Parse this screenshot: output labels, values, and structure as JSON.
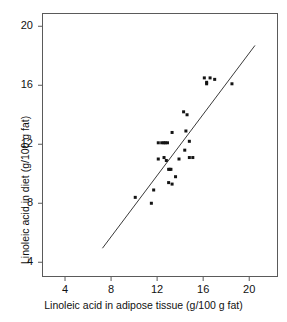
{
  "chart_data": {
    "type": "scatter",
    "title": "",
    "xlabel": "Linoleic acid in adipose tissue (g/100 g fat)",
    "ylabel": "Linoleic acid in diet (g/100 g fat)",
    "xlim": [
      2.0,
      22.5
    ],
    "ylim": [
      3.0,
      20.9
    ],
    "xticks": [
      4,
      8,
      12,
      16,
      20
    ],
    "yticks": [
      4,
      8,
      12,
      16,
      20
    ],
    "xtick_labels": [
      "4",
      "8",
      "12",
      "16",
      "20"
    ],
    "ytick_labels": [
      "4",
      "8",
      "12",
      "16",
      "20"
    ],
    "grid": false,
    "legend": null,
    "marker": "square",
    "marker_color": "#141414",
    "marker_size": 3,
    "frame_color": "#5a5a5a",
    "points": [
      [
        10.1,
        8.4
      ],
      [
        11.5,
        8.0
      ],
      [
        11.7,
        8.9
      ],
      [
        12.1,
        12.1
      ],
      [
        12.1,
        11.0
      ],
      [
        12.4,
        12.1
      ],
      [
        12.6,
        12.1
      ],
      [
        12.7,
        12.1
      ],
      [
        12.9,
        12.1
      ],
      [
        12.6,
        11.1
      ],
      [
        12.8,
        10.9
      ],
      [
        13.0,
        10.3
      ],
      [
        13.1,
        10.3
      ],
      [
        13.2,
        10.3
      ],
      [
        13.0,
        9.4
      ],
      [
        13.3,
        9.3
      ],
      [
        13.3,
        12.8
      ],
      [
        13.6,
        9.8
      ],
      [
        13.9,
        11.0
      ],
      [
        14.4,
        11.6
      ],
      [
        14.5,
        12.9
      ],
      [
        14.3,
        14.2
      ],
      [
        14.6,
        14.0
      ],
      [
        14.8,
        12.2
      ],
      [
        14.8,
        11.1
      ],
      [
        15.1,
        11.1
      ],
      [
        16.1,
        16.5
      ],
      [
        16.3,
        16.2
      ],
      [
        16.3,
        16.1
      ],
      [
        16.6,
        16.5
      ],
      [
        17.0,
        16.4
      ],
      [
        18.5,
        16.1
      ]
    ],
    "fit_line": {
      "label": "regression line",
      "x_start": 7.25,
      "y_start": 4.95,
      "x_end": 20.5,
      "y_end": 18.7,
      "color": "#3a3a3a",
      "width": 1
    }
  }
}
